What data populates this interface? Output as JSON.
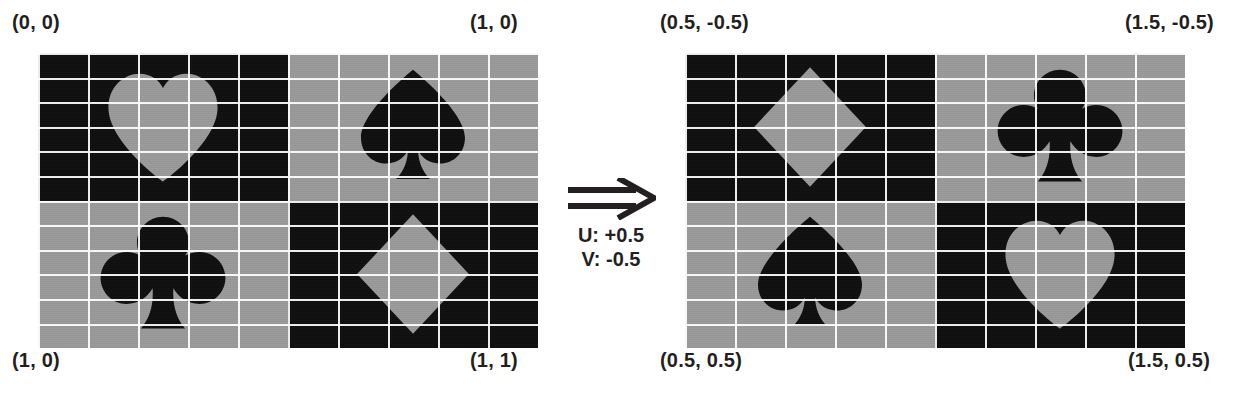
{
  "diagram": {
    "colors": {
      "dark": "#100f10",
      "light": "#9a9a9a",
      "grid_line": "#ffffff",
      "text": "#231f20",
      "background": "#ffffff"
    },
    "transform": {
      "arrow_glyph": "double-right-arrow",
      "u_label": "U: +0.5",
      "v_label": "V: -0.5"
    },
    "panels": [
      {
        "id": "source-texture",
        "name": "left-texture",
        "corners": {
          "top_left": "(0, 0)",
          "top_right": "(1, 0)",
          "bottom_left": "(1, 0)",
          "bottom_right": "(1, 1)"
        },
        "grid": {
          "columns": 10,
          "rows": 12
        },
        "quadrants": [
          {
            "position": "top-left",
            "background": "dark",
            "suit": "heart",
            "suit_color": "light"
          },
          {
            "position": "top-right",
            "background": "light",
            "suit": "spade",
            "suit_color": "dark"
          },
          {
            "position": "bottom-left",
            "background": "light",
            "suit": "club",
            "suit_color": "dark"
          },
          {
            "position": "bottom-right",
            "background": "dark",
            "suit": "diamond",
            "suit_color": "light"
          }
        ]
      },
      {
        "id": "offset-texture",
        "name": "right-texture",
        "corners": {
          "top_left": "(0.5, -0.5)",
          "top_right": "(1.5, -0.5)",
          "bottom_left": "(0.5, 0.5)",
          "bottom_right": "(1.5, 0.5)"
        },
        "grid": {
          "columns": 10,
          "rows": 12
        },
        "quadrants": [
          {
            "position": "top-left",
            "background": "dark",
            "suit": "diamond",
            "suit_color": "light"
          },
          {
            "position": "top-right",
            "background": "light",
            "suit": "club",
            "suit_color": "dark"
          },
          {
            "position": "bottom-left",
            "background": "light",
            "suit": "spade",
            "suit_color": "dark"
          },
          {
            "position": "bottom-right",
            "background": "dark",
            "suit": "heart",
            "suit_color": "light"
          }
        ]
      }
    ]
  }
}
